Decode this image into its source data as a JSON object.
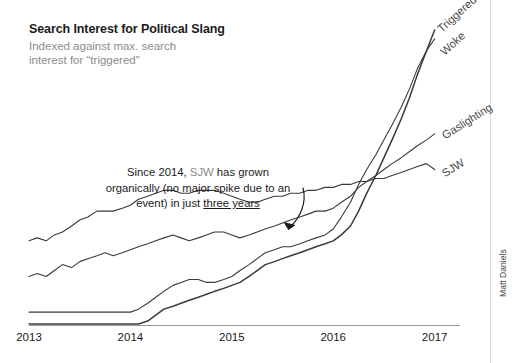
{
  "header": {
    "title": "Search Interest for Political Slang",
    "subtitle": "Indexed against max. search\ninterest for “triggered”"
  },
  "annotation": {
    "part1": "Since 2014, ",
    "term": "SJW",
    "part2": " has grown organically (no major spike due to an event) in just ",
    "emphasis": "three years",
    "arrow_name": "annotation-arrow"
  },
  "credit": "Matt Daniels",
  "colors": {
    "text": "#1b1b1b",
    "muted": "#8c8c8c",
    "line": "#3a3a3a",
    "axis": "#9a9a9a",
    "background": "#ffffff"
  },
  "chart_data": {
    "type": "line",
    "title": "Search Interest for Political Slang",
    "subtitle": "Indexed against max. search interest for “triggered”",
    "xlabel": "",
    "ylabel": "",
    "grid": false,
    "legend": "inline-end-of-line",
    "xlim": [
      2013.0,
      2017.25
    ],
    "ylim": [
      0,
      100
    ],
    "xticks": [
      "2013",
      "2014",
      "2015",
      "2016",
      "2017"
    ],
    "xtick_values": [
      2013,
      2014,
      2015,
      2016,
      2017
    ],
    "x": [
      2013.0,
      2013.08,
      2013.17,
      2013.25,
      2013.33,
      2013.42,
      2013.5,
      2013.58,
      2013.67,
      2013.75,
      2013.83,
      2013.92,
      2014.0,
      2014.08,
      2014.17,
      2014.25,
      2014.33,
      2014.42,
      2014.5,
      2014.58,
      2014.67,
      2014.75,
      2014.83,
      2014.92,
      2015.0,
      2015.08,
      2015.17,
      2015.25,
      2015.33,
      2015.42,
      2015.5,
      2015.58,
      2015.67,
      2015.75,
      2015.83,
      2015.92,
      2016.0,
      2016.08,
      2016.17,
      2016.25,
      2016.33,
      2016.42,
      2016.5,
      2016.58,
      2016.67,
      2016.75,
      2016.83,
      2016.92,
      2017.0
    ],
    "series": [
      {
        "name": "Triggered",
        "label": "Triggered",
        "color": "#3a3a3a",
        "values": [
          0,
          0,
          0,
          0,
          0,
          0,
          0,
          0,
          0,
          0,
          0,
          0,
          0,
          0,
          1,
          3,
          5,
          6,
          7,
          8,
          9,
          10,
          11,
          12,
          13,
          14,
          16,
          18,
          20,
          21,
          22,
          23,
          24,
          25,
          26,
          27,
          28,
          30,
          33,
          38,
          44,
          50,
          56,
          62,
          69,
          76,
          84,
          92,
          99
        ]
      },
      {
        "name": "Woke",
        "label": "Woke",
        "color": "#3a3a3a",
        "values": [
          4,
          4,
          4,
          4,
          4,
          4,
          4,
          4,
          4,
          4,
          4,
          4,
          4,
          5,
          7,
          9,
          11,
          13,
          14,
          15,
          15,
          14,
          14,
          15,
          16,
          18,
          20,
          22,
          24,
          25,
          26,
          26,
          27,
          28,
          29,
          30,
          32,
          36,
          41,
          47,
          52,
          57,
          62,
          67,
          73,
          79,
          86,
          92,
          96
        ]
      },
      {
        "name": "Gaslighting",
        "label": "Gaslighting",
        "color": "#3a3a3a",
        "values": [
          16,
          17,
          16,
          18,
          20,
          19,
          21,
          22,
          23,
          24,
          23,
          24,
          25,
          26,
          27,
          28,
          29,
          30,
          29,
          28,
          29,
          30,
          31,
          31,
          30,
          29,
          30,
          31,
          32,
          33,
          34,
          35,
          36,
          37,
          38,
          38,
          39,
          41,
          43,
          46,
          48,
          50,
          52,
          54,
          56,
          58,
          60,
          62,
          64
        ]
      },
      {
        "name": "SJW",
        "label": "SJW",
        "color": "#3a3a3a",
        "values": [
          28,
          29,
          28,
          30,
          31,
          33,
          35,
          36,
          38,
          38,
          38,
          39,
          40,
          42,
          43,
          44,
          45,
          45,
          44,
          44,
          45,
          45,
          45,
          44,
          43,
          42,
          41,
          41,
          42,
          43,
          43,
          44,
          44,
          45,
          45,
          46,
          46,
          47,
          47,
          48,
          48,
          49,
          49,
          50,
          51,
          52,
          53,
          54,
          52
        ]
      }
    ]
  }
}
